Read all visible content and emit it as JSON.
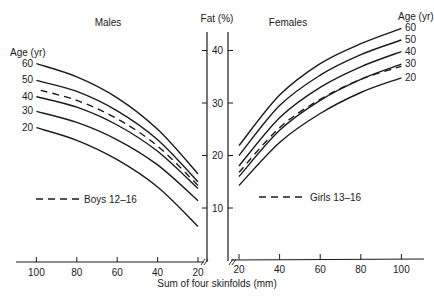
{
  "chart_data": [
    {
      "type": "line",
      "title": "Males",
      "xlabel": "Sum of four skinfolds (mm)",
      "ylabel": "Fat (%)",
      "x_direction": "reversed",
      "xlim": [
        110,
        20
      ],
      "ylim": [
        0,
        45
      ],
      "x_ticks": [
        100,
        80,
        60,
        40,
        20
      ],
      "y_ticks": [
        10,
        20,
        30,
        40
      ],
      "legend_title": "Age (yr)",
      "grid": false,
      "x": [
        20,
        40,
        60,
        80,
        100
      ],
      "series": [
        {
          "name": "60",
          "style": "solid",
          "values": [
            16.5,
            25.0,
            31.0,
            35.0,
            37.5
          ]
        },
        {
          "name": "50",
          "style": "solid",
          "values": [
            15.0,
            23.0,
            28.5,
            32.2,
            34.3
          ]
        },
        {
          "name": "Boys 12–16",
          "style": "dashed",
          "values": [
            14.3,
            21.8,
            27.0,
            30.5,
            32.6
          ]
        },
        {
          "name": "40",
          "style": "solid",
          "values": [
            13.7,
            20.8,
            25.8,
            29.2,
            31.2
          ]
        },
        {
          "name": "30",
          "style": "solid",
          "values": [
            11.4,
            18.2,
            23.0,
            26.3,
            28.4
          ]
        },
        {
          "name": "20",
          "style": "solid",
          "values": [
            6.5,
            14.0,
            19.2,
            22.9,
            25.3
          ]
        }
      ],
      "annotation": "Boys 12–16"
    },
    {
      "type": "line",
      "title": "Females",
      "xlabel": "Sum of four skinfolds (mm)",
      "ylabel": "Fat (%)",
      "xlim": [
        20,
        110
      ],
      "ylim": [
        0,
        45
      ],
      "x_ticks": [
        20,
        40,
        60,
        80,
        100
      ],
      "y_ticks": [
        10,
        20,
        30,
        40
      ],
      "legend_title": "Age (yr)",
      "grid": false,
      "x": [
        20,
        40,
        60,
        80,
        100
      ],
      "series": [
        {
          "name": "60",
          "style": "solid",
          "values": [
            21.9,
            31.5,
            37.5,
            41.3,
            44.2
          ]
        },
        {
          "name": "50",
          "style": "solid",
          "values": [
            20.0,
            29.5,
            35.3,
            39.2,
            42.0
          ]
        },
        {
          "name": "40",
          "style": "solid",
          "values": [
            18.0,
            27.2,
            33.0,
            36.9,
            39.8
          ]
        },
        {
          "name": "Girls 13–16",
          "style": "dashed",
          "values": [
            16.8,
            25.3,
            30.7,
            34.5,
            37.0
          ]
        },
        {
          "name": "30",
          "style": "solid",
          "values": [
            16.0,
            24.8,
            30.5,
            34.5,
            37.4
          ]
        },
        {
          "name": "20",
          "style": "solid",
          "values": [
            14.3,
            22.5,
            28.0,
            32.0,
            34.8
          ]
        }
      ],
      "annotation": "Girls 13–16"
    }
  ],
  "labels": {
    "males_title": "Males",
    "females_title": "Females",
    "y_axis_title": "Fat (%)",
    "x_axis_title": "Sum of four skinfolds (mm)",
    "age_title_left": "Age (yr)",
    "age_title_right": "Age (yr)",
    "boys_legend": "Boys 12–16",
    "girls_legend": "Girls 13–16"
  },
  "colors": {
    "ink": "#1a1a1a",
    "background": "#ffffff"
  }
}
